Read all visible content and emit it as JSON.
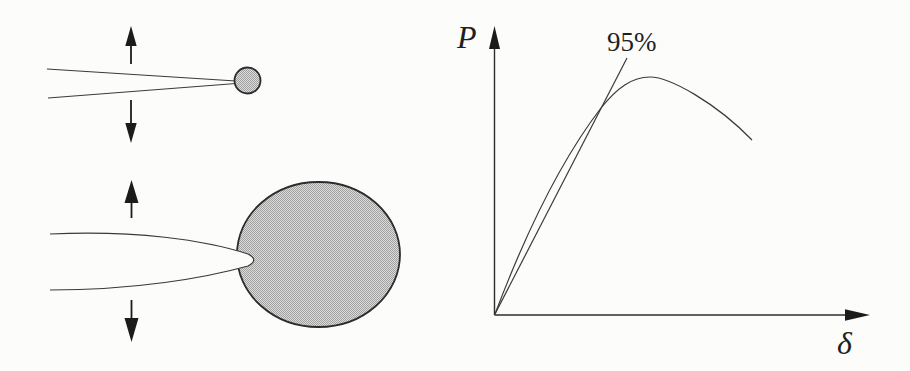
{
  "graph": {
    "y_axis_label": "P",
    "x_axis_label": "δ",
    "secant_annotation": "95%"
  },
  "left_panel": {
    "icons": {
      "top_diagram": [
        "arrow-up-icon",
        "arrow-down-icon"
      ],
      "bottom_diagram": [
        "arrow-up-icon",
        "arrow-down-icon"
      ]
    }
  },
  "colors": {
    "background": "#fcfcfb",
    "line_ink": "#3a3a3a",
    "arrow_ink": "#1b1b1b",
    "plastic_zone_fill_light": "#dcdcdc",
    "plastic_zone_fill_dark": "#a0a0a0",
    "plastic_zone_outline": "#2c2c2c",
    "text_ink": "#1f1f1f"
  }
}
